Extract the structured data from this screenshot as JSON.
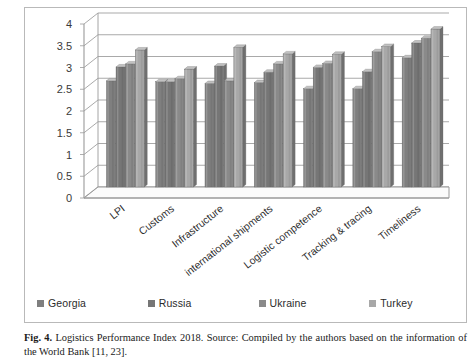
{
  "figure": {
    "caption_label": "Fig. 4.",
    "caption_text": "Logistics Performance Index 2018. Source: Compiled by the authors based on the information of the World Bank [11, 23]."
  },
  "legend": {
    "position": "bottom",
    "items": [
      {
        "label": "Georgia",
        "color": "#7f7f7f"
      },
      {
        "label": "Russia",
        "color": "#767676"
      },
      {
        "label": "Ukraine",
        "color": "#8a8a8a"
      },
      {
        "label": "Turkey",
        "color": "#a8a8a8"
      }
    ]
  },
  "axis": {
    "y_ticks": [
      "0",
      "0.5",
      "1",
      "1.5",
      "2",
      "2.5",
      "3",
      "3.5",
      "4"
    ],
    "y_min": 0,
    "y_max": 4,
    "y_step": 0.5
  },
  "chart_data": {
    "type": "bar",
    "title": "Logistics Performance Index 2018",
    "xlabel": "",
    "ylabel": "",
    "ylim": [
      0,
      4
    ],
    "grid": true,
    "legend_position": "bottom",
    "categories": [
      "LPI",
      "Customs",
      "Infrastructure",
      "international shipments",
      "Logistic competence",
      "Tracking & tracing",
      "Timeliness"
    ],
    "series": [
      {
        "name": "Georgia",
        "color": "#7f7f7f",
        "values": [
          2.44,
          2.42,
          2.38,
          2.4,
          2.26,
          2.26,
          2.97
        ]
      },
      {
        "name": "Russia",
        "color": "#767676",
        "values": [
          2.76,
          2.42,
          2.78,
          2.64,
          2.75,
          2.65,
          3.31
        ]
      },
      {
        "name": "Ukraine",
        "color": "#8a8a8a",
        "values": [
          2.83,
          2.49,
          2.44,
          2.83,
          2.84,
          3.11,
          3.42
        ]
      },
      {
        "name": "Turkey",
        "color": "#a8a8a8",
        "values": [
          3.15,
          2.71,
          3.21,
          3.06,
          3.05,
          3.23,
          3.63
        ]
      }
    ]
  }
}
